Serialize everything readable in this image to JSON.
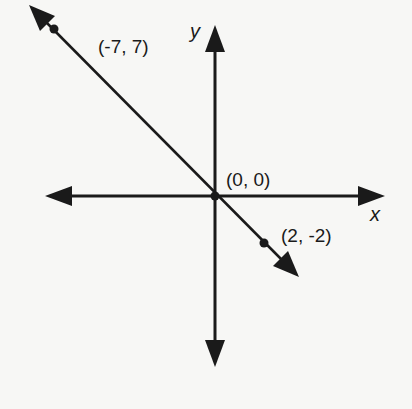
{
  "diagram": {
    "type": "coordinate-plane-line",
    "axes": {
      "x_label": "x",
      "y_label": "y"
    },
    "points": [
      {
        "label": "(-7, 7)",
        "x": -7,
        "y": 7
      },
      {
        "label": "(0, 0)",
        "x": 0,
        "y": 0
      },
      {
        "label": "(2, -2)",
        "x": 2,
        "y": -2
      }
    ],
    "line": {
      "equation": "y = -x",
      "arrows_both_ends": true
    },
    "colors": {
      "ink": "#1a1a1a",
      "background": "#f7f7f5"
    }
  }
}
